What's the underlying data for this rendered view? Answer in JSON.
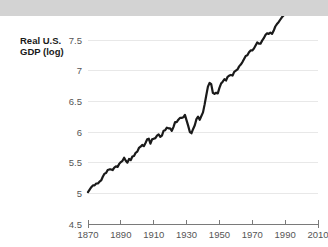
{
  "chart_data": {
    "type": "line",
    "title": "",
    "subtitle": "",
    "xlabel": "",
    "ylabel": "Real U.S. GDP (log)",
    "ylabel_lines": [
      "Real U.S.",
      "GDP (log)"
    ],
    "xlim": [
      1870,
      2010
    ],
    "ylim": [
      4.5,
      7.5
    ],
    "grid": true,
    "legend": "none",
    "line_color": "#1a1a1a",
    "grid_color": "#e8e8e8",
    "axis_color": "#7a7a7a",
    "tick_label_color": "#555555",
    "axis_title_color": "#1a1a1a",
    "background_color": "#ffffff",
    "top_band_color": "#d3d3d3",
    "yticks": [
      7.5,
      7,
      6.5,
      6,
      5.5,
      5,
      4.5
    ],
    "ytick_labels": [
      "7.5",
      "7",
      "6.5",
      "6",
      "5.5",
      "5",
      "4.5"
    ],
    "xticks": [
      1870,
      1890,
      1910,
      1930,
      1950,
      1970,
      1990,
      2010
    ],
    "xtick_labels": [
      "1870",
      "1890",
      "1910",
      "1930",
      "1950",
      "1970",
      "1990",
      "2010"
    ],
    "series": [
      {
        "name": "Real U.S. GDP (log)",
        "x": [
          1870,
          1871,
          1872,
          1873,
          1874,
          1875,
          1876,
          1877,
          1878,
          1879,
          1880,
          1881,
          1882,
          1883,
          1884,
          1885,
          1886,
          1887,
          1888,
          1889,
          1890,
          1891,
          1892,
          1893,
          1894,
          1895,
          1896,
          1897,
          1898,
          1899,
          1900,
          1901,
          1902,
          1903,
          1904,
          1905,
          1906,
          1907,
          1908,
          1909,
          1910,
          1911,
          1912,
          1913,
          1914,
          1915,
          1916,
          1917,
          1918,
          1919,
          1920,
          1921,
          1922,
          1923,
          1924,
          1925,
          1926,
          1927,
          1928,
          1929,
          1930,
          1931,
          1932,
          1933,
          1934,
          1935,
          1936,
          1937,
          1938,
          1939,
          1940,
          1941,
          1942,
          1943,
          1944,
          1945,
          1946,
          1947,
          1948,
          1949,
          1950,
          1951,
          1952,
          1953,
          1954,
          1955,
          1956,
          1957,
          1958,
          1959,
          1960,
          1961,
          1962,
          1963,
          1964,
          1965,
          1966,
          1967,
          1968,
          1969,
          1970,
          1971,
          1972,
          1973,
          1974,
          1975,
          1976,
          1977,
          1978,
          1979,
          1980,
          1981,
          1982,
          1983,
          1984,
          1985,
          1986,
          1987,
          1988,
          1989,
          1990,
          1991,
          1992,
          1993,
          1994,
          1995,
          1996,
          1997,
          1998,
          1999,
          2000,
          2001,
          2002,
          2003,
          2004,
          2005,
          2006,
          2007,
          2008,
          2009,
          2010
        ],
        "values": [
          5.02,
          5.06,
          5.1,
          5.13,
          5.13,
          5.16,
          5.16,
          5.19,
          5.21,
          5.27,
          5.32,
          5.33,
          5.38,
          5.39,
          5.39,
          5.38,
          5.42,
          5.44,
          5.43,
          5.48,
          5.51,
          5.53,
          5.58,
          5.53,
          5.5,
          5.56,
          5.54,
          5.6,
          5.61,
          5.66,
          5.68,
          5.74,
          5.76,
          5.79,
          5.77,
          5.82,
          5.88,
          5.89,
          5.81,
          5.88,
          5.89,
          5.9,
          5.94,
          5.96,
          5.92,
          5.94,
          6.02,
          6.03,
          6.07,
          6.06,
          6.06,
          6.02,
          6.08,
          6.16,
          6.16,
          6.2,
          6.23,
          6.23,
          6.24,
          6.28,
          6.19,
          6.1,
          6.0,
          5.98,
          6.05,
          6.11,
          6.21,
          6.25,
          6.2,
          6.26,
          6.32,
          6.45,
          6.6,
          6.74,
          6.8,
          6.78,
          6.64,
          6.62,
          6.64,
          6.63,
          6.72,
          6.79,
          6.82,
          6.86,
          6.84,
          6.9,
          6.92,
          6.93,
          6.92,
          6.98,
          7.0,
          7.02,
          7.07,
          7.1,
          7.14,
          7.19,
          7.24,
          7.25,
          7.3,
          7.33,
          7.33,
          7.36,
          7.41,
          7.46,
          7.44,
          7.44,
          7.49,
          7.53,
          7.58,
          7.61,
          7.6,
          7.62,
          7.6,
          7.65,
          7.72,
          7.76,
          7.79,
          7.83,
          7.87,
          7.9,
          7.92,
          7.91,
          7.95,
          7.98,
          8.02,
          8.05,
          8.09,
          8.13,
          8.17,
          8.21,
          8.25,
          8.26,
          8.28,
          8.31,
          8.35,
          8.38,
          8.41,
          8.43,
          8.43,
          8.4,
          8.42
        ]
      }
    ]
  }
}
